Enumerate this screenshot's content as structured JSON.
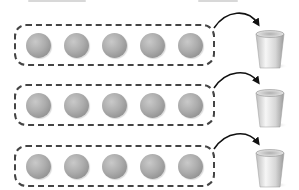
{
  "diagram": {
    "colors": {
      "dash_border": "#444444",
      "sphere_light": "#c9c9c9",
      "sphere_dark": "#7a7a7a",
      "arrow": "#111111",
      "cup_light": "#f4f4f4",
      "cup_dark": "#a8a8a8"
    },
    "groups": [
      {
        "id": "group-1",
        "sphere_count": 5,
        "target": "cup-1"
      },
      {
        "id": "group-2",
        "sphere_count": 5,
        "target": "cup-2"
      },
      {
        "id": "group-3",
        "sphere_count": 5,
        "target": "cup-3"
      }
    ],
    "icons": {
      "sphere": "sphere-icon",
      "arrow": "curved-arrow-icon",
      "cup": "cup-icon"
    }
  }
}
